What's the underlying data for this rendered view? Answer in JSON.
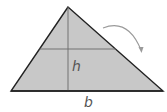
{
  "diagram": {
    "labels": {
      "height": "h",
      "base": "b"
    },
    "colors": {
      "fill": "#c8c8c8",
      "outline": "#222222",
      "inner_lines": "#6a6a6a",
      "arrow": "#9a9a9a",
      "label": "#555555",
      "background": "#ffffff"
    },
    "shape": {
      "apex": [
        68,
        7
      ],
      "base_left": [
        11,
        91
      ],
      "base_right": [
        163,
        91
      ],
      "midline_y": 49
    }
  }
}
